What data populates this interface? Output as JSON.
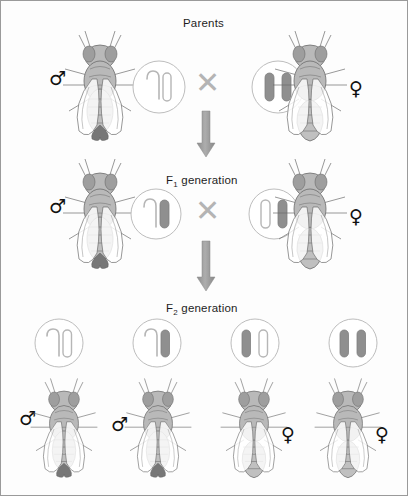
{
  "diagram": {
    "title_row_label": "Parents",
    "f1_label_prefix": "F",
    "f1_label_sub": "1",
    "f1_label_suffix": " generation",
    "f2_label_prefix": "F",
    "f2_label_sub": "2",
    "f2_label_suffix": " generation",
    "cross_symbol": "✕",
    "male_symbol": "♂",
    "female_symbol": "♀",
    "colors": {
      "chromosome_fill_gray": "#8f8f8f",
      "chromosome_outline": "#b6b6b6",
      "circle_outline": "#bdbdbd",
      "arrow_gray": "#9a9a9a",
      "text": "#1d1d1d",
      "fly_body": "#b9b9b9",
      "fly_line": "#6b6b6b",
      "page_background": "#fdfdfd"
    }
  },
  "rows": {
    "parents": {
      "label": "Parents",
      "male": {
        "sex": "♂",
        "genotype_left": "hooked-outline",
        "genotype_right": "straight-outline"
      },
      "female": {
        "sex": "♀",
        "genotype_left": "straight-filled",
        "genotype_right": "straight-filled"
      }
    },
    "f1": {
      "label": "F1 generation",
      "male": {
        "sex": "♂",
        "genotype_left": "hooked-outline",
        "genotype_right": "straight-filled"
      },
      "female": {
        "sex": "♀",
        "genotype_left": "straight-outline",
        "genotype_right": "straight-filled"
      }
    },
    "f2": {
      "label": "F2 generation",
      "offspring": [
        {
          "sex": "♂",
          "sex_side": "left",
          "genotype_left": "hooked-outline",
          "genotype_right": "straight-outline"
        },
        {
          "sex": "♂",
          "sex_side": "left",
          "genotype_left": "hooked-outline",
          "genotype_right": "straight-filled"
        },
        {
          "sex": "♀",
          "sex_side": "right",
          "genotype_left": "straight-filled",
          "genotype_right": "straight-outline"
        },
        {
          "sex": "♀",
          "sex_side": "right",
          "genotype_left": "straight-filled",
          "genotype_right": "straight-filled"
        }
      ]
    }
  }
}
